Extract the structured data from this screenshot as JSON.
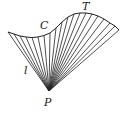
{
  "diagram": {
    "type": "conical-surface",
    "labels": {
      "curve": "C",
      "tangent_point": "T",
      "generator_line": "l",
      "apex": "P"
    },
    "apex": [
      49,
      91
    ],
    "curve_points": [
      [
        8,
        32
      ],
      [
        14,
        34
      ],
      [
        20,
        36
      ],
      [
        26,
        37
      ],
      [
        32,
        37.5
      ],
      [
        38,
        37
      ],
      [
        44,
        35.5
      ],
      [
        50,
        33
      ],
      [
        56,
        28
      ],
      [
        62,
        22
      ],
      [
        68,
        17
      ],
      [
        74,
        14
      ],
      [
        80,
        13
      ],
      [
        86,
        13
      ],
      [
        92,
        14
      ],
      [
        98,
        16
      ],
      [
        104,
        19
      ],
      [
        110,
        23
      ],
      [
        115,
        26
      ],
      [
        119,
        30
      ]
    ],
    "colors": {
      "stroke": "#222222",
      "background": "#ffffff"
    }
  }
}
